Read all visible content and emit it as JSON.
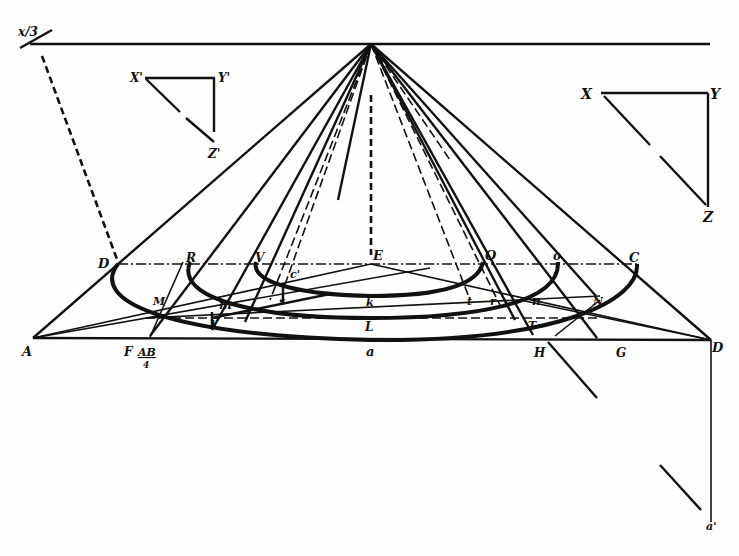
{
  "diagram": {
    "type": "perspective construction of concentric circles (cone / horizon)",
    "ink_color": "#111111",
    "paper_color": "#fefefe",
    "horizon": {
      "label": "x/3",
      "y": 44,
      "x_start": 28,
      "x_end": 710
    },
    "vanishing_point": {
      "x": 371,
      "y": 44
    },
    "left_triangle": {
      "labels": {
        "top_left": "X'",
        "top_right": "Y'",
        "bottom": "Z'"
      }
    },
    "right_triangle": {
      "labels": {
        "top_left": "X",
        "top_right": "Y",
        "bottom": "Z"
      }
    },
    "points": {
      "D_left": "D",
      "R": "R",
      "V": "V",
      "c_prime": "c'",
      "E": "E",
      "O": "O",
      "o": "o",
      "C": "C",
      "M": "M",
      "m": "m",
      "s": "s",
      "k": "k",
      "t": "t",
      "r": "r",
      "n": "n",
      "N": "N",
      "L": "L",
      "Y_inner": "Y",
      "T_inner": "T",
      "A": "A",
      "F": "F",
      "AB_over_4": "AB",
      "four": "4",
      "a": "a",
      "H": "H",
      "G": "G",
      "D_right": "D",
      "a_prime": "a'"
    }
  }
}
